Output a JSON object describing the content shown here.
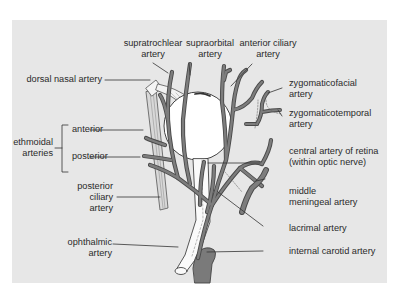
{
  "figure": {
    "colors": {
      "panel_bg": "#e7e7e7",
      "vessel": "#7a7a7a",
      "vessel_outline": "#4a4a4a",
      "eyeball": "#ffffff",
      "leader_line": "#3a3a3a",
      "text": "#2a2a2a"
    },
    "labels": {
      "supratrochlear": [
        "supratrochlear",
        "artery"
      ],
      "supraorbital": [
        "supraorbital",
        "artery"
      ],
      "anterior_ciliary": [
        "anterior ciliary",
        "artery"
      ],
      "dorsal_nasal": "dorsal nasal artery",
      "zygomaticofacial": [
        "zygomaticofacial",
        "artery"
      ],
      "zygomaticotemporal": [
        "zygomaticotemporal",
        "artery"
      ],
      "ethmoidal_group": [
        "ethmoidal",
        "arteries"
      ],
      "ethmoidal_anterior": "anterior",
      "ethmoidal_posterior": "posterior",
      "central_retina": [
        "central artery of retina",
        "(within optic nerve)"
      ],
      "posterior_ciliary": [
        "posterior",
        "ciliary",
        "artery"
      ],
      "middle_meningeal": [
        "middle",
        "meningeal artery"
      ],
      "lacrimal": "lacrimal artery",
      "ophthalmic": [
        "ophthalmic",
        "artery"
      ],
      "internal_carotid": "internal carotid artery"
    }
  }
}
